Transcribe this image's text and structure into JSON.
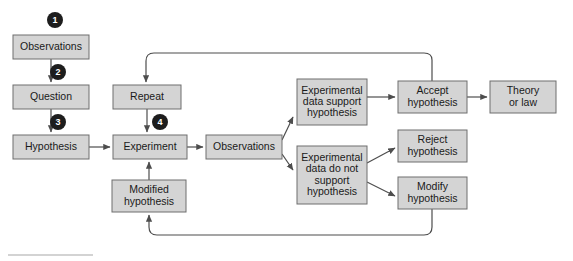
{
  "figure": {
    "background_color": "#ffffff",
    "node_fill": "#d4d4d4",
    "node_stroke": "#6e6e6e",
    "connector_color": "#4d4d4d",
    "badge_color": "#1d1d1d",
    "badge_text_color": "#ffffff"
  },
  "nodes": [
    {
      "id": "observations-1",
      "label": "Observations",
      "lines": [
        "Observations"
      ],
      "x": 13,
      "y": 35,
      "w": 76,
      "h": 24
    },
    {
      "id": "question",
      "label": "Question",
      "lines": [
        "Question"
      ],
      "x": 13,
      "y": 85,
      "w": 76,
      "h": 24
    },
    {
      "id": "hypothesis",
      "label": "Hypothesis",
      "lines": [
        "Hypothesis"
      ],
      "x": 13,
      "y": 135,
      "w": 76,
      "h": 24
    },
    {
      "id": "repeat",
      "label": "Repeat",
      "lines": [
        "Repeat"
      ],
      "x": 113,
      "y": 85,
      "w": 68,
      "h": 24
    },
    {
      "id": "experiment",
      "label": "Experiment",
      "lines": [
        "Experiment"
      ],
      "x": 113,
      "y": 135,
      "w": 74,
      "h": 24
    },
    {
      "id": "modified-hypothesis",
      "label": "Modified hypothesis",
      "lines": [
        "Modified",
        "hypothesis"
      ],
      "x": 112,
      "y": 180,
      "w": 74,
      "h": 32
    },
    {
      "id": "observations-2",
      "label": "Observations",
      "lines": [
        "Observations"
      ],
      "x": 206,
      "y": 135,
      "w": 76,
      "h": 24
    },
    {
      "id": "data-support",
      "label": "Experimental data support hypothesis",
      "lines": [
        "Experimental",
        "data support",
        "hypothesis"
      ],
      "x": 297,
      "y": 79,
      "w": 70,
      "h": 46
    },
    {
      "id": "data-not-support",
      "label": "Experimental data do not support hypothesis",
      "lines": [
        "Experimental",
        "data do not",
        "support",
        "hypothesis"
      ],
      "x": 297,
      "y": 146,
      "w": 70,
      "h": 58
    },
    {
      "id": "accept-hypothesis",
      "label": "Accept hypothesis",
      "lines": [
        "Accept",
        "hypothesis"
      ],
      "x": 398,
      "y": 81,
      "w": 69,
      "h": 32
    },
    {
      "id": "reject-hypothesis",
      "label": "Reject hypothesis",
      "lines": [
        "Reject",
        "hypothesis"
      ],
      "x": 398,
      "y": 130,
      "w": 69,
      "h": 32
    },
    {
      "id": "modify-hypothesis",
      "label": "Modify hypothesis",
      "lines": [
        "Modify",
        "hypothesis"
      ],
      "x": 398,
      "y": 177,
      "w": 69,
      "h": 32
    },
    {
      "id": "theory-or-law",
      "label": "Theory or law",
      "lines": [
        "Theory",
        "or law"
      ],
      "x": 490,
      "y": 81,
      "w": 66,
      "h": 32
    }
  ],
  "badges": [
    {
      "id": "step-1",
      "number": "1",
      "cx": 55,
      "cy": 20,
      "r": 8
    },
    {
      "id": "step-2",
      "number": "2",
      "cx": 58,
      "cy": 72,
      "r": 8
    },
    {
      "id": "step-3",
      "number": "3",
      "cx": 58,
      "cy": 122,
      "r": 8
    },
    {
      "id": "step-4",
      "number": "4",
      "cx": 160,
      "cy": 122,
      "r": 8
    }
  ],
  "connectors": [
    {
      "id": "observations-to-question",
      "from": "observations-1",
      "to": "question",
      "d": "M 51 59 L 51 82",
      "arrow": true
    },
    {
      "id": "question-to-hypothesis",
      "from": "question",
      "to": "hypothesis",
      "d": "M 51 109 L 51 132",
      "arrow": true
    },
    {
      "id": "hypothesis-to-experiment",
      "from": "hypothesis",
      "to": "experiment",
      "d": "M 89 147 L 110 147",
      "arrow": true
    },
    {
      "id": "repeat-to-experiment",
      "from": "repeat",
      "to": "experiment",
      "d": "M 147 109 L 147 132",
      "arrow": true
    },
    {
      "id": "modified-to-experiment",
      "from": "modified-hypothesis",
      "to": "experiment",
      "d": "M 149 180 L 149 162",
      "arrow": true
    },
    {
      "id": "experiment-to-observations",
      "from": "experiment",
      "to": "observations-2",
      "d": "M 187 147 L 203 147",
      "arrow": true
    },
    {
      "id": "observations-to-support",
      "from": "observations-2",
      "to": "data-support",
      "d": "M 282 140 L 293 117",
      "arrow": true
    },
    {
      "id": "observations-to-not-support",
      "from": "observations-2",
      "to": "data-not-support",
      "d": "M 282 154 L 293 170",
      "arrow": true
    },
    {
      "id": "support-to-accept",
      "from": "data-support",
      "to": "accept-hypothesis",
      "d": "M 367 97 L 395 97",
      "arrow": true
    },
    {
      "id": "accept-to-theory",
      "from": "accept-hypothesis",
      "to": "theory-or-law",
      "d": "M 467 97 L 487 97",
      "arrow": true
    },
    {
      "id": "not-support-to-reject",
      "from": "data-not-support",
      "to": "reject-hypothesis",
      "d": "M 367 163 L 395 148",
      "arrow": true
    },
    {
      "id": "not-support-to-modify",
      "from": "data-not-support",
      "to": "modify-hypothesis",
      "d": "M 367 182 L 395 196",
      "arrow": true
    },
    {
      "id": "accept-loop-to-repeat",
      "from": "accept-hypothesis",
      "to": "repeat",
      "d": "M 432 81 L 432 60 Q 432 53 424 53 L 154 53 Q 146 53 146 61 L 146 82",
      "arrow": true
    },
    {
      "id": "modify-loop-to-modified",
      "from": "modify-hypothesis",
      "to": "modified-hypothesis",
      "d": "M 432 209 L 432 227 Q 432 235 424 235 L 157 235 Q 149 235 149 227 L 149 215",
      "arrow": true
    }
  ],
  "caption_rule": {
    "id": "caption-rule",
    "x1": 8,
    "y1": 255,
    "x2": 93,
    "y2": 255
  }
}
